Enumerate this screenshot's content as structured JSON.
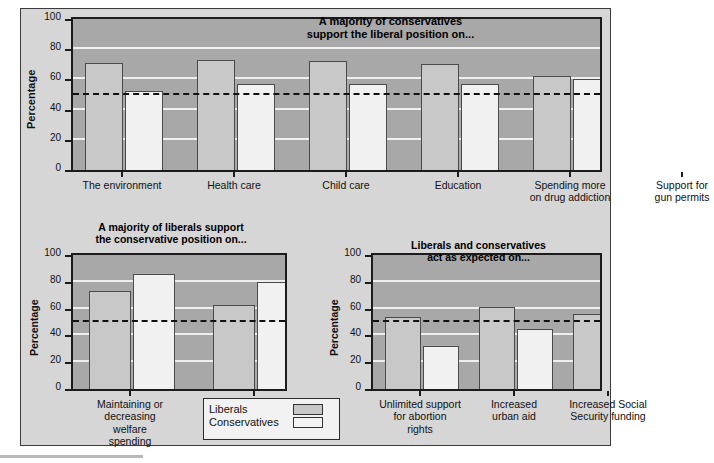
{
  "figure": {
    "background_color": "#d6d6d6",
    "liberal_color": "#c8c8c8",
    "conservative_color": "#f1f1f1",
    "reference_line_value": 50
  },
  "legend": {
    "liberals_label": "Liberals",
    "conservatives_label": "Conservatives"
  },
  "chart_data": [
    {
      "id": "top",
      "type": "bar",
      "title": "A majority of conservatives\nsupport the liberal position on...",
      "xlabel": "",
      "ylabel": "Percentage",
      "ylim": [
        0,
        100
      ],
      "yticks": [
        0,
        20,
        40,
        60,
        80,
        100
      ],
      "grid": true,
      "legend_position": "external-bottom",
      "reference_line": 50,
      "categories": [
        "The environment",
        "Health care",
        "Child care",
        "Education",
        "Spending more\non drug addiction",
        "Support for\ngun permits"
      ],
      "series": [
        {
          "name": "Liberals",
          "values": [
            71,
            73,
            72,
            70,
            62,
            82
          ]
        },
        {
          "name": "Conservatives",
          "values": [
            52,
            57,
            57,
            57,
            60,
            72
          ]
        }
      ]
    },
    {
      "id": "bottom-left",
      "type": "bar",
      "title": "A majority of liberals support\nthe conservative position on...",
      "xlabel": "",
      "ylabel": "Percentage",
      "ylim": [
        0,
        100
      ],
      "yticks": [
        0,
        20,
        40,
        60,
        80,
        100
      ],
      "grid": true,
      "legend_position": "external-bottom",
      "reference_line": 50,
      "categories": [
        "Maintaining or\ndecreasing\nwelfare\nspending",
        "Support for the\ndeath penalty"
      ],
      "series": [
        {
          "name": "Liberals",
          "values": [
            73,
            63
          ]
        },
        {
          "name": "Conservatives",
          "values": [
            86,
            80
          ]
        }
      ]
    },
    {
      "id": "bottom-right",
      "type": "bar",
      "title": "Liberals and conservatives\nact as expected on...",
      "xlabel": "",
      "ylabel": "Percentage",
      "ylim": [
        0,
        100
      ],
      "yticks": [
        0,
        20,
        40,
        60,
        80,
        100
      ],
      "grid": true,
      "legend_position": "external-bottom",
      "reference_line": 50,
      "categories": [
        "Unlimited support\nfor abortion\nrights",
        "Increased\nurban aid",
        "Increased Social\nSecurity funding"
      ],
      "series": [
        {
          "name": "Liberals",
          "values": [
            54,
            61,
            56
          ]
        },
        {
          "name": "Conservatives",
          "values": [
            32,
            45,
            49
          ]
        }
      ]
    }
  ]
}
